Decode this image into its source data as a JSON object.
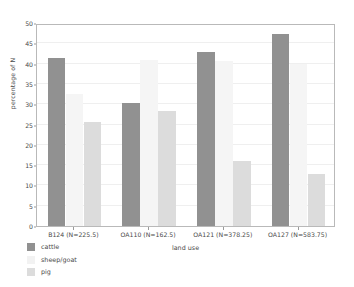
{
  "chart_data": {
    "type": "bar",
    "title": "",
    "subtitle": "",
    "xlabel": "land use",
    "ylabel": "percentage of N",
    "categories": [
      "B124 (N=225.5)",
      "OA110 (N=162.5)",
      "OA121 (N=378.25)",
      "OA127 (N=583.75)"
    ],
    "series": [
      {
        "name": "cattle",
        "color": "#919191",
        "values": [
          41.5,
          30.2,
          42.9,
          47.4
        ]
      },
      {
        "name": "sheep/goat",
        "color": "#f5f5f5",
        "values": [
          32.5,
          41.0,
          40.6,
          39.8
        ]
      },
      {
        "name": "pig",
        "color": "#dcdcdc",
        "values": [
          25.6,
          28.3,
          16.0,
          12.9
        ]
      }
    ],
    "ylim": [
      0,
      50
    ],
    "yticks": [
      0,
      5,
      10,
      15,
      20,
      25,
      30,
      35,
      40,
      45,
      50
    ],
    "ytick_labels": [
      "0",
      "5",
      "10",
      "15",
      "20",
      "25",
      "30",
      "35",
      "40",
      "45",
      "50"
    ],
    "grid": true,
    "grid_color": "#efefef",
    "legend_position": "below-left",
    "legend_entries": [
      "cattle",
      "sheep/goat",
      "pig"
    ],
    "frame_color": "#b9b9b9",
    "background": "#ffffff"
  }
}
